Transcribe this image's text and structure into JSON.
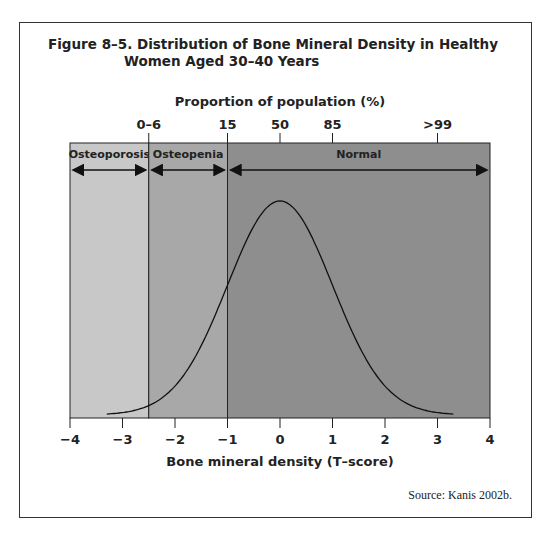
{
  "chart_data": {
    "type": "area",
    "title_line1": "Figure 8–5. Distribution of Bone Mineral Density in Healthy",
    "title_line2": "Women Aged 30–40 Years",
    "xlabel": "Bone mineral density (T–score)",
    "top_axis_label": "Proportion of population (%)",
    "xlim": [
      -4,
      4
    ],
    "x_ticks": [
      "−4",
      "−3",
      "−2",
      "−1",
      "0",
      "1",
      "2",
      "3",
      "4"
    ],
    "top_ticks": [
      {
        "label": "0–6",
        "t": -2.5
      },
      {
        "label": "15",
        "t": -1
      },
      {
        "label": "50",
        "t": 0
      },
      {
        "label": "85",
        "t": 1
      },
      {
        "label": ">99",
        "t": 3
      }
    ],
    "regions": [
      {
        "name": "Osteoporosis",
        "from": -4,
        "to": -2.5,
        "color": "#c8c8c8"
      },
      {
        "name": "Osteopenia",
        "from": -2.5,
        "to": -1,
        "color": "#a8a8a8"
      },
      {
        "name": "Normal",
        "from": -1,
        "to": 4,
        "color": "#8e8e8e"
      }
    ],
    "curve": {
      "distribution": "normal",
      "mean": 0,
      "sd": 1,
      "x_range": [
        -3.3,
        3.3
      ]
    },
    "source": "Source: Kanis 2002b."
  }
}
